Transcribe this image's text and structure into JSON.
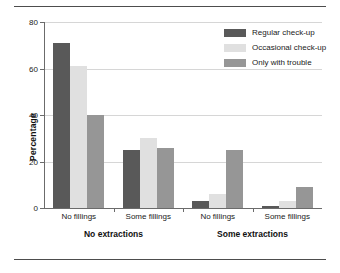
{
  "chart_data": {
    "type": "bar",
    "title": "",
    "xlabel": "",
    "ylabel": "Percentage",
    "ylim": [
      0,
      80
    ],
    "yticks": [
      0,
      20,
      40,
      60,
      80
    ],
    "ytick_labels": [
      "0",
      "20",
      "40",
      "60",
      "80"
    ],
    "grid": true,
    "legend_position": "top-right",
    "categories": [
      "No fillings",
      "Some fillings",
      "No fillings",
      "Some fillings"
    ],
    "group_labels": [
      "No extractions",
      "Some extractions"
    ],
    "series": [
      {
        "name": "Regular check-up",
        "color": "#595959",
        "values": [
          71,
          25,
          3,
          1
        ]
      },
      {
        "name": "Occasional check-up",
        "color": "#e0e0e0",
        "values": [
          61,
          30,
          6,
          3
        ]
      },
      {
        "name": "Only with trouble",
        "color": "#969696",
        "values": [
          40,
          26,
          25,
          9
        ]
      }
    ]
  },
  "axis": {
    "y_label": "Percentage",
    "y_ticks": [
      "80",
      "60",
      "40",
      "20",
      "0"
    ]
  },
  "legend": {
    "items": [
      {
        "label": "Regular check-up"
      },
      {
        "label": "Occasional check-up"
      },
      {
        "label": "Only with trouble"
      }
    ]
  },
  "xaxis": {
    "categories": [
      {
        "label": "No fillings"
      },
      {
        "label": "Some fillings"
      },
      {
        "label": "No fillings"
      },
      {
        "label": "Some fillings"
      }
    ],
    "groups": [
      {
        "label": "No extractions"
      },
      {
        "label": "Some extractions"
      }
    ]
  }
}
